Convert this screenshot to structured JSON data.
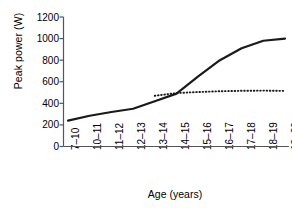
{
  "chart_data": {
    "type": "line",
    "title": "",
    "xlabel": "Age (years)",
    "ylabel": "Peak power (W)",
    "categories": [
      "7–10",
      "10–11",
      "11–12",
      "12–13",
      "13–14",
      "14–15",
      "15–16",
      "16–17",
      "17–18",
      "18–19",
      "19–20"
    ],
    "yticks": [
      0,
      200,
      400,
      600,
      800,
      1000,
      1200
    ],
    "ylim": [
      0,
      1200
    ],
    "grid": false,
    "legend": "none",
    "series": [
      {
        "name": "solid",
        "style": "solid",
        "color": "#1a1a1a",
        "x": [
          "7–10",
          "10–11",
          "11–12",
          "12–13",
          "13–14",
          "14–15",
          "15–16",
          "16–17",
          "17–18",
          "18–19",
          "19–20"
        ],
        "values": [
          240,
          285,
          320,
          350,
          420,
          490,
          650,
          800,
          910,
          980,
          1000
        ]
      },
      {
        "name": "dotted",
        "style": "dotted",
        "color": "#1a1a1a",
        "x": [
          "13–14",
          "14–15",
          "15–16",
          "16–17",
          "17–18",
          "18–19",
          "19–20"
        ],
        "values": [
          470,
          495,
          505,
          512,
          516,
          518,
          515
        ]
      }
    ]
  },
  "axis": {
    "y_tick_labels": [
      "1200",
      "1000",
      "800",
      "600",
      "400",
      "200",
      "0"
    ],
    "y_title": "Peak power (W)",
    "x_title": "Age (years)",
    "x_tick_labels": [
      "7–10",
      "10–11",
      "11–12",
      "12–13",
      "13–14",
      "14–15",
      "15–16",
      "16–17",
      "17–18",
      "18–19",
      "19–20"
    ]
  },
  "colors": {
    "line": "#1a1a1a",
    "axis": "#555555",
    "background": "#ffffff"
  }
}
